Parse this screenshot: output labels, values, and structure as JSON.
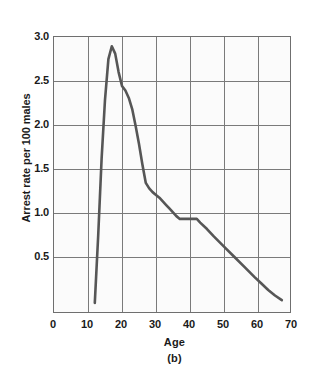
{
  "chart_data": {
    "type": "line",
    "title": "",
    "subtitle": "",
    "caption": "(b)",
    "xlabel": "Age",
    "ylabel": "Arrest rate per 100 males",
    "xlim": [
      0,
      70
    ],
    "ylim": [
      0,
      3.0
    ],
    "xticks": [
      0,
      10,
      20,
      30,
      40,
      50,
      60,
      70
    ],
    "xtick_labels": [
      "0",
      "10",
      "20",
      "30",
      "40",
      "50",
      "60",
      "70"
    ],
    "yticks": [
      0.5,
      1.0,
      1.5,
      2.0,
      2.5,
      3.0
    ],
    "ytick_labels": [
      "0.5",
      "1.0",
      "1.5",
      "2.0",
      "2.5",
      "3.0"
    ],
    "grid": true,
    "legend": null,
    "series": [
      {
        "name": "Arrest rate per 100 males",
        "color": "#565656",
        "line_width": 2.6,
        "x": [
          12,
          13,
          14,
          15,
          16,
          17,
          18,
          19,
          20,
          21,
          22,
          23,
          24,
          25,
          26,
          27,
          28,
          29,
          30,
          31,
          32,
          33,
          34,
          35,
          36,
          37,
          38,
          39,
          40,
          41,
          42,
          43,
          45,
          47,
          50,
          53,
          56,
          59,
          61,
          63,
          65,
          67
        ],
        "y": [
          0.12,
          0.85,
          1.68,
          2.32,
          2.76,
          2.9,
          2.82,
          2.62,
          2.47,
          2.42,
          2.34,
          2.22,
          2.04,
          1.84,
          1.62,
          1.42,
          1.36,
          1.32,
          1.29,
          1.26,
          1.22,
          1.18,
          1.14,
          1.1,
          1.06,
          1.03,
          1.03,
          1.03,
          1.03,
          1.03,
          1.03,
          0.99,
          0.92,
          0.84,
          0.73,
          0.62,
          0.51,
          0.4,
          0.33,
          0.26,
          0.2,
          0.15
        ]
      }
    ],
    "annotations": []
  },
  "figure": {
    "background": "#ffffff",
    "plot_background": "#fbfbfb",
    "frame_color": "#6f6f6f",
    "grid_color": "#7a7a7a"
  }
}
